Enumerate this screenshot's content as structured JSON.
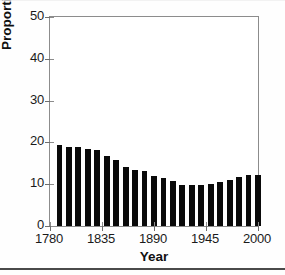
{
  "chart_data": {
    "type": "bar",
    "title": "",
    "xlabel": "Year",
    "ylabel": "Proportion Black",
    "xlim": [
      1780,
      2000
    ],
    "ylim": [
      0,
      50
    ],
    "grid": false,
    "legend": null,
    "x_ticks": [
      "1780",
      "1835",
      "1890",
      "1945",
      "2000"
    ],
    "x_tick_values": [
      1780,
      1835,
      1890,
      1945,
      2000
    ],
    "y_ticks": [
      "0",
      "10",
      "20",
      "30",
      "40",
      "50"
    ],
    "y_tick_values": [
      0,
      10,
      20,
      30,
      40,
      50
    ],
    "bar_color": "#0a0a0a",
    "categories": [
      1790,
      1800,
      1810,
      1820,
      1830,
      1840,
      1850,
      1860,
      1870,
      1880,
      1890,
      1900,
      1910,
      1920,
      1930,
      1940,
      1950,
      1960,
      1970,
      1980,
      1990,
      2000
    ],
    "values": [
      19.3,
      18.9,
      19.0,
      18.4,
      18.1,
      16.8,
      15.7,
      14.1,
      13.5,
      13.1,
      11.9,
      11.6,
      10.7,
      9.9,
      9.7,
      9.8,
      10.0,
      10.5,
      11.1,
      11.7,
      12.1,
      12.3
    ]
  },
  "axis": {
    "y_title": "Proportion Black",
    "x_title": "Year"
  }
}
